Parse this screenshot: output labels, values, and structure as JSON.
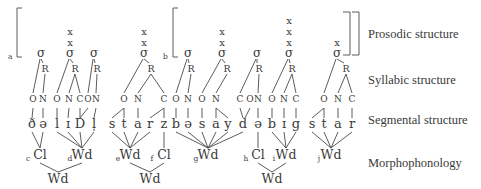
{
  "labels": {
    "prosodic": "Prosodic structure",
    "syllabic": "Syllabic structure",
    "segmental": "Segmental structure",
    "morphophonology": "Morphophonology"
  },
  "panel_letters": {
    "a": "a",
    "b": "b"
  },
  "symbols": {
    "sigma": "σ",
    "rhyme": "R",
    "grid_mark": "x"
  },
  "segments": [
    {
      "ch": "ð",
      "x": 32
    },
    {
      "ch": "ə",
      "x": 43
    },
    {
      "ch": "l",
      "x": 57
    },
    {
      "ch": "ɪ",
      "x": 68
    },
    {
      "ch": "D",
      "x": 80
    },
    {
      "ch": "l̩",
      "x": 94
    },
    {
      "ch": "s",
      "x": 112
    },
    {
      "ch": "t",
      "x": 124
    },
    {
      "ch": "a",
      "x": 138
    },
    {
      "ch": "r",
      "x": 150
    },
    {
      "ch": "z",
      "x": 164
    },
    {
      "ch": "b",
      "x": 176
    },
    {
      "ch": "ə",
      "x": 188
    },
    {
      "ch": "s",
      "x": 202
    },
    {
      "ch": "a",
      "x": 216
    },
    {
      "ch": "y",
      "x": 228
    },
    {
      "ch": "d",
      "x": 243
    },
    {
      "ch": "ə",
      "x": 258
    },
    {
      "ch": "b",
      "x": 272
    },
    {
      "ch": "ɪ",
      "x": 284
    },
    {
      "ch": "g",
      "x": 296
    },
    {
      "ch": "s",
      "x": 312
    },
    {
      "ch": "t",
      "x": 324
    },
    {
      "ch": "a",
      "x": 338
    },
    {
      "ch": "r",
      "x": 352
    }
  ],
  "syllables": [
    {
      "x": 41,
      "grid": 0,
      "onset": {
        "label": "O",
        "x": 33,
        "segs": [
          0
        ]
      },
      "rhyme": {
        "x": 45,
        "parts": [
          {
            "label": "N",
            "x": 43,
            "segs": [
              1
            ]
          }
        ]
      }
    },
    {
      "x": 70,
      "grid": 2,
      "onset": {
        "label": "O",
        "x": 57,
        "segs": [
          2
        ]
      },
      "rhyme": {
        "x": 75,
        "parts": [
          {
            "label": "N",
            "x": 69,
            "segs": [
              3
            ]
          },
          {
            "label": "C",
            "x": 80,
            "segs": [
              4
            ]
          }
        ]
      }
    },
    {
      "x": 94,
      "grid": 0,
      "onset": {
        "label": "O",
        "x": 88,
        "segs": [
          4
        ]
      },
      "rhyme": {
        "x": 97,
        "parts": [
          {
            "label": "N",
            "x": 96,
            "segs": [
              5
            ]
          }
        ]
      }
    },
    {
      "x": 144,
      "grid": 2,
      "onset": {
        "label": "O",
        "x": 124,
        "segs": [
          6,
          7
        ]
      },
      "rhyme": {
        "x": 151,
        "parts": [
          {
            "label": "N",
            "x": 138,
            "segs": [
              8
            ]
          },
          {
            "label": "C",
            "x": 164,
            "segs": [
              9,
              10
            ]
          }
        ]
      }
    },
    {
      "x": 188,
      "grid": 0,
      "onset": {
        "label": "O",
        "x": 176,
        "segs": [
          11
        ]
      },
      "rhyme": {
        "x": 191,
        "parts": [
          {
            "label": "N",
            "x": 188,
            "segs": [
              12
            ]
          }
        ]
      }
    },
    {
      "x": 222,
      "grid": 2,
      "onset": {
        "label": "O",
        "x": 202,
        "segs": [
          13
        ]
      },
      "rhyme": {
        "x": 227,
        "parts": [
          {
            "label": "N",
            "x": 216,
            "segs": [
              14,
              15
            ]
          }
        ]
      }
    },
    {
      "x": 257,
      "grid": 0,
      "onset": {
        "label": "C",
        "x": 240,
        "segs": [
          16
        ]
      },
      "rhyme": {
        "x": 259,
        "parts": [
          {
            "label": "N",
            "x": 258,
            "segs": [
              17
            ]
          }
        ]
      },
      "onset_label_pre": {
        "label": "O",
        "x": 250
      }
    },
    {
      "x": 289,
      "grid": 3,
      "onset": {
        "label": "O",
        "x": 272,
        "segs": [
          18
        ]
      },
      "rhyme": {
        "x": 292,
        "parts": [
          {
            "label": "N",
            "x": 284,
            "segs": [
              19
            ]
          },
          {
            "label": "C",
            "x": 296,
            "segs": [
              20
            ]
          }
        ]
      }
    },
    {
      "x": 337,
      "grid": 1,
      "onset": {
        "label": "O",
        "x": 324,
        "segs": [
          21,
          22
        ]
      },
      "rhyme": {
        "x": 346,
        "parts": [
          {
            "label": "N",
            "x": 338,
            "segs": [
              23
            ]
          },
          {
            "label": "C",
            "x": 352,
            "segs": [
              24
            ]
          }
        ]
      }
    }
  ],
  "morpho": [
    {
      "id": "c",
      "label": "Cl",
      "x": 40,
      "segs": [
        0,
        1
      ]
    },
    {
      "id": "d",
      "label": "Wd",
      "x": 82,
      "segs": [
        2,
        3,
        4,
        5
      ]
    },
    {
      "id": "e",
      "label": "Wd",
      "x": 130,
      "segs": [
        6,
        7,
        8,
        9
      ]
    },
    {
      "id": "f",
      "label": "Cl",
      "x": 164,
      "segs": [
        10
      ]
    },
    {
      "id": "g",
      "label": "Wd",
      "x": 208,
      "segs": [
        11,
        12,
        13,
        14,
        15,
        16
      ]
    },
    {
      "id": "h",
      "label": "Cl",
      "x": 258,
      "segs": [
        17
      ]
    },
    {
      "id": "i",
      "label": "Wd",
      "x": 286,
      "segs": [
        18,
        19,
        20
      ]
    },
    {
      "id": "j",
      "label": "Wd",
      "x": 331,
      "segs": [
        21,
        22,
        23,
        24
      ]
    }
  ],
  "words": [
    {
      "label": "Wd",
      "x": 58,
      "children": [
        0,
        1
      ]
    },
    {
      "label": "Wd",
      "x": 150,
      "children": [
        2,
        3
      ]
    },
    {
      "label": "Wd",
      "x": 272,
      "children": [
        5,
        6
      ]
    }
  ]
}
